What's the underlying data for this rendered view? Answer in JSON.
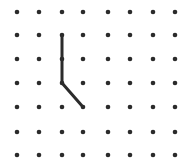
{
  "grid": {
    "columns_x": [
      17,
      39,
      62,
      83,
      108,
      130,
      153,
      175
    ],
    "rows_y": [
      12,
      35,
      59,
      83,
      107,
      132,
      155
    ],
    "dot_radius": 2.3,
    "dot_color": "#2b2b2b"
  },
  "path": {
    "points": [
      [
        2,
        1
      ],
      [
        2,
        3
      ],
      [
        3,
        4
      ]
    ],
    "stroke_color": "#2b2b2b",
    "stroke_width": 3
  }
}
